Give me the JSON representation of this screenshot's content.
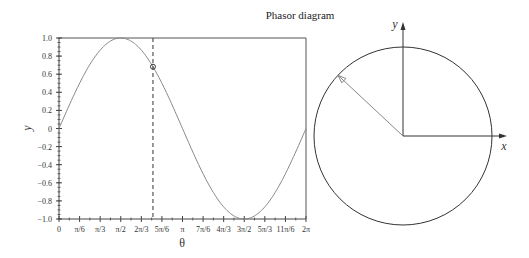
{
  "title": "Phasor diagram",
  "chart_data": [
    {
      "type": "line",
      "title": "",
      "xlabel": "θ",
      "ylabel": "y",
      "function": "y = sin(θ)",
      "xlim": [
        0,
        6.283185
      ],
      "ylim": [
        -1.0,
        1.0
      ],
      "x_tick_labels": [
        "0",
        "π/6",
        "π/3",
        "π/2",
        "2π/3",
        "5π/6",
        "π",
        "7π/6",
        "4π/3",
        "3π/2",
        "5π/3",
        "11π/6",
        "2π"
      ],
      "y_tick_labels": [
        "1.0",
        "0.8",
        "0.6",
        "0.4",
        "0.2",
        "0",
        "−0.2",
        "−0.4",
        "−0.6",
        "−0.8",
        "−1.0"
      ],
      "y_ticks": [
        1.0,
        0.8,
        0.6,
        0.4,
        0.2,
        0,
        -0.2,
        -0.4,
        -0.6,
        -0.8,
        -1.0
      ],
      "grid": false,
      "series": [
        {
          "name": "sin θ",
          "x": [
            0,
            0.5236,
            1.0472,
            1.5708,
            2.0944,
            2.618,
            3.1416,
            3.6652,
            4.1888,
            4.7124,
            5.236,
            5.7596,
            6.2832
          ],
          "values": [
            0,
            0.5,
            0.866,
            1.0,
            0.866,
            0.5,
            0,
            -0.5,
            -0.866,
            -1.0,
            -0.866,
            -0.5,
            0
          ],
          "color": "#888888"
        }
      ],
      "marker": {
        "theta": 2.39,
        "y": 0.68,
        "style": "open-circle"
      },
      "vertical_dashed_line": {
        "theta": 2.39
      }
    },
    {
      "type": "diagram",
      "title": "Phasor diagram",
      "xlabel": "x",
      "ylabel": "y",
      "circle": {
        "radius": 1.0
      },
      "phasor": {
        "angle_rad": 2.39,
        "length": 1.0,
        "color": "#888888"
      }
    }
  ],
  "labels": {
    "x_axis": "θ",
    "y_axis": "y",
    "phasor_x": "x",
    "phasor_y": "y"
  }
}
